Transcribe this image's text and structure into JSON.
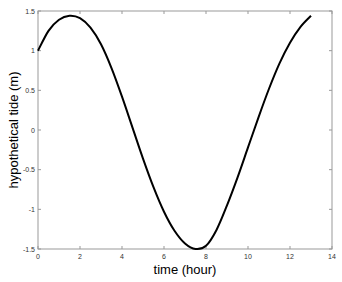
{
  "chart_data": {
    "type": "line",
    "title": "",
    "xlabel": "time (hour)",
    "ylabel": "hypothetical tide (m)",
    "xlim": [
      0,
      14
    ],
    "ylim": [
      -1.5,
      1.5
    ],
    "xticks": [
      0,
      2,
      4,
      6,
      8,
      10,
      12,
      14
    ],
    "yticks": [
      -1.5,
      -1,
      -0.5,
      0,
      0.5,
      1,
      1.5
    ],
    "xtick_labels": [
      "0",
      "2",
      "4",
      "6",
      "8",
      "10",
      "12",
      "14"
    ],
    "ytick_labels": [
      "-1.5",
      "-1",
      "-0.5",
      "0",
      "0.5",
      "1",
      "1.5"
    ],
    "grid": false,
    "legend": null,
    "series": [
      {
        "name": "hypothetical tide",
        "color": "#000000",
        "x": [
          0,
          0.5,
          1,
          1.5,
          2,
          2.5,
          3,
          3.5,
          4,
          4.5,
          5,
          5.5,
          6,
          6.5,
          7,
          7.5,
          8,
          8.5,
          9,
          9.5,
          10,
          10.5,
          11,
          11.5,
          12,
          12.5,
          13
        ],
        "y": [
          1.0,
          1.25,
          1.39,
          1.44,
          1.41,
          1.29,
          1.08,
          0.78,
          0.42,
          0.03,
          -0.36,
          -0.72,
          -1.03,
          -1.27,
          -1.43,
          -1.5,
          -1.46,
          -1.26,
          -0.95,
          -0.6,
          -0.22,
          0.16,
          0.52,
          0.84,
          1.1,
          1.3,
          1.44
        ]
      }
    ]
  }
}
